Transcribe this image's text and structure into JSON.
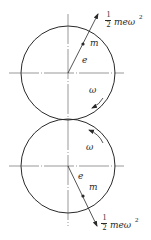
{
  "figure": {
    "colors": {
      "line": "#2a2a2a",
      "background": "#ffffff"
    },
    "upper_rotor": {
      "center": [
        68,
        73
      ],
      "radius": 47,
      "eccentric_label": "e",
      "mass_label": "m",
      "omega_label": "ω",
      "force_label": {
        "numerator": "1",
        "denominator": "2",
        "body": "meω",
        "exponent": "2"
      },
      "rotation": "clockwise"
    },
    "lower_rotor": {
      "center": [
        68,
        166
      ],
      "radius": 47,
      "eccentric_label": "e",
      "mass_label": "m",
      "omega_label": "ω",
      "force_label": {
        "numerator": "1",
        "denominator": "2",
        "body": "meω",
        "exponent": "2"
      },
      "rotation": "counterclockwise"
    }
  }
}
